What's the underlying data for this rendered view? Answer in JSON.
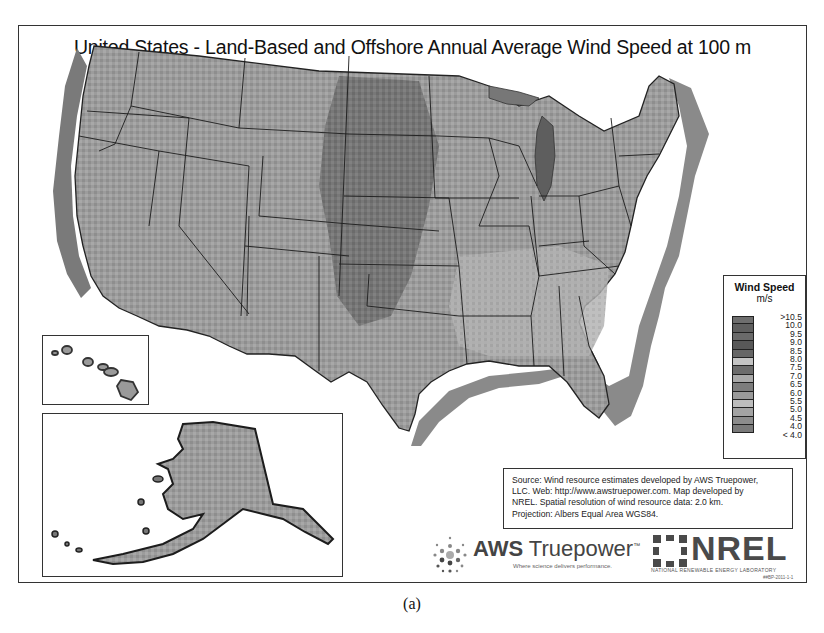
{
  "figure": {
    "title": "United States - Land-Based and Offshore Annual Average Wind Speed at 100 m",
    "caption": "(a)"
  },
  "map": {
    "regions": [
      "Contiguous United States",
      "Hawaii (inset)",
      "Alaska (inset)"
    ],
    "offshore_shading": true,
    "state_boundaries": true
  },
  "legend": {
    "title": "Wind Speed",
    "unit": "m/s",
    "items": [
      {
        "label": ">10.5",
        "color": "#6e6e6e"
      },
      {
        "label": "10.0",
        "color": "#5f5f5f"
      },
      {
        "label": "9.5",
        "color": "#6a6a6a"
      },
      {
        "label": "9.0",
        "color": "#585858"
      },
      {
        "label": "8.5",
        "color": "#666666"
      },
      {
        "label": "8.0",
        "color": "#c4c4c4"
      },
      {
        "label": "7.5",
        "color": "#6c6c6c"
      },
      {
        "label": "7.0",
        "color": "#a9a9a9"
      },
      {
        "label": "6.5",
        "color": "#7d7d7d"
      },
      {
        "label": "6.0",
        "color": "#9a9a9a"
      },
      {
        "label": "5.5",
        "color": "#bdbdbd"
      },
      {
        "label": "5.0",
        "color": "#a3a3a3"
      },
      {
        "label": "4.5",
        "color": "#8c8c8c"
      },
      {
        "label": "4.0",
        "color": "#7a7a7a"
      },
      {
        "label": "< 4.0",
        "color": "#8a8a8a"
      }
    ]
  },
  "source_note": {
    "lines": [
      "Source: Wind resource estimates developed by AWS Truepower,",
      "LLC.  Web: http://www.awstruepower.com. Map developed by",
      "NREL.  Spatial resolution of wind resource data: 2.0 km.",
      "Projection: Albers Equal Area WGS84."
    ]
  },
  "logos": {
    "aws": {
      "name_bold": "AWS",
      "name_light": " Truepower",
      "tm": "™",
      "tagline": "Where science delivers performance."
    },
    "nrel": {
      "name": "NREL",
      "subtitle": "NATIONAL RENEWABLE ENERGY LABORATORY",
      "code": "##BP-2011-1-1"
    }
  }
}
